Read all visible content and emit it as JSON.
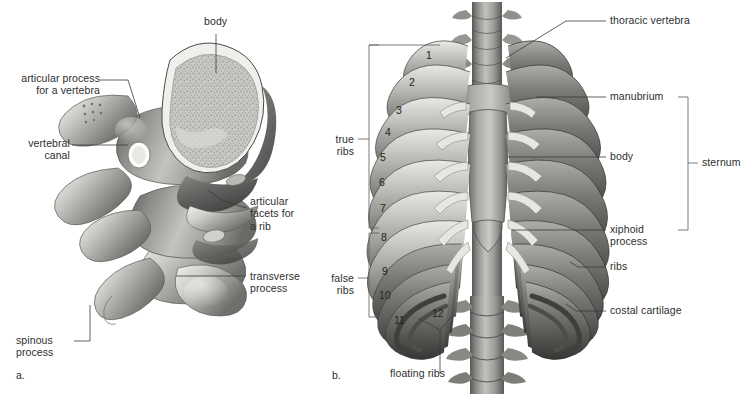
{
  "figure": {
    "background": "#ffffff",
    "text_color": "#2e2e2e",
    "leader_color": "#3a3a3a"
  },
  "panel_a": {
    "id": "a.",
    "caption": "thoracic vertebrae (lateral view)",
    "labels": {
      "body": "body",
      "articular_process": "articular process\nfor a vertebra",
      "vertebral_canal": "vertebral\ncanal",
      "articular_facets": "articular\nfacets for\na rib",
      "transverse_process": "transverse\nprocess",
      "spinous_process": "spinous\nprocess"
    }
  },
  "panel_b": {
    "id": "b.",
    "caption": "rib cage (anterior view)",
    "labels": {
      "thoracic_vertebra": "thoracic vertebra",
      "manubrium": "manubrium",
      "body": "body",
      "xiphoid_process": "xiphoid\nprocess",
      "ribs": "ribs",
      "costal_cartilage": "costal cartilage",
      "sternum": "sternum",
      "true_ribs": "true\nribs",
      "false_ribs": "false\nribs",
      "floating_ribs": "floating ribs"
    },
    "rib_numbers": [
      "1",
      "2",
      "3",
      "4",
      "5",
      "6",
      "7",
      "8",
      "9",
      "10",
      "11",
      "12"
    ],
    "brackets": {
      "true_ribs_range": "1-7",
      "false_ribs_range": "8-10",
      "floating_ribs_range": "11-12",
      "sternum_range": "manubrium-xiphoid process"
    }
  }
}
